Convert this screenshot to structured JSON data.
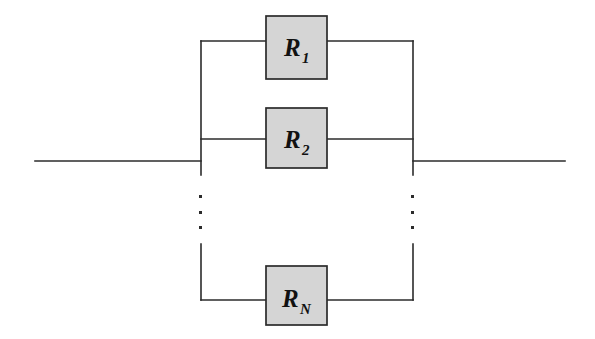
{
  "diagram": {
    "type": "circuit-schematic",
    "colors": {
      "background": "#ffffff",
      "wire": "#2b2b2b",
      "component_fill": "#d5d5d5",
      "component_stroke": "#2b2b2b",
      "label_text": "#111111"
    },
    "canvas": {
      "width": 595,
      "height": 339
    },
    "geometry": {
      "left_bus_x": 201,
      "right_bus_x": 413,
      "terminal_y": 161,
      "left_terminal_start_x": 35,
      "right_terminal_end_x": 565,
      "box_left_x": 266,
      "box_right_x": 327
    },
    "components": [
      {
        "id": "r1",
        "name": "resistor-r1",
        "label_main": "R",
        "label_sub": "1",
        "branch_y": 41,
        "box_top_y": 16,
        "box_bottom_y": 79
      },
      {
        "id": "r2",
        "name": "resistor-r2",
        "label_main": "R",
        "label_sub": "2",
        "branch_y": 139,
        "box_top_y": 108,
        "box_bottom_y": 168
      },
      {
        "id": "rn",
        "name": "resistor-rn",
        "label_main": "R",
        "label_sub": "N",
        "branch_y": 300,
        "box_top_y": 266,
        "box_bottom_y": 325
      }
    ],
    "ellipsis": {
      "name": "vertical-ellipsis",
      "symbol": "⋮",
      "dot_count": 3,
      "dot_size": 3,
      "left_x": 201,
      "right_x": 413,
      "dot_y_positions": [
        196,
        212,
        227
      ]
    },
    "terminals": [
      {
        "id": "left-terminal",
        "label": ""
      },
      {
        "id": "right-terminal",
        "label": ""
      }
    ]
  }
}
